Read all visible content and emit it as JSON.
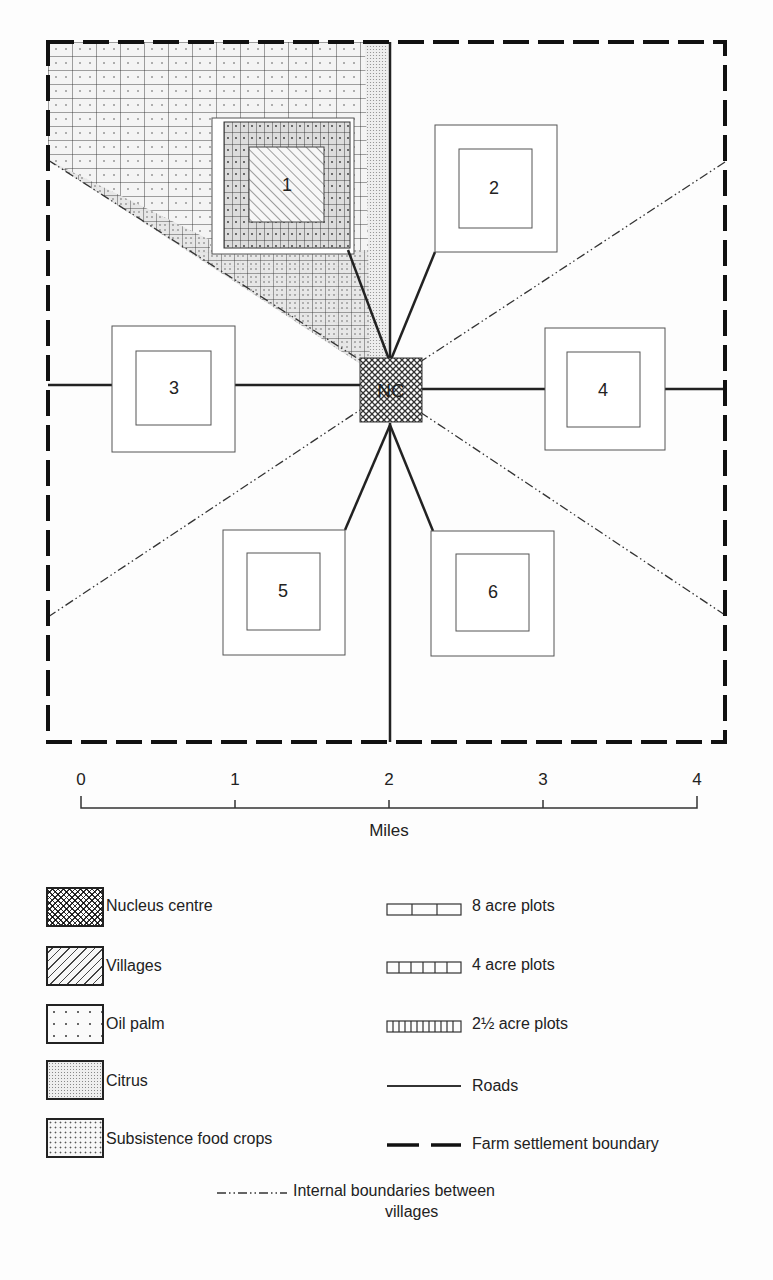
{
  "diagram": {
    "title": "",
    "center": {
      "label": "NC",
      "name": "Nucleus centre"
    },
    "villages": [
      {
        "id": "village-1",
        "label": "1",
        "pattern": "villages-hatched"
      },
      {
        "id": "village-2",
        "label": "2"
      },
      {
        "id": "village-3",
        "label": "3"
      },
      {
        "id": "village-4",
        "label": "4"
      },
      {
        "id": "village-5",
        "label": "5"
      },
      {
        "id": "village-6",
        "label": "6"
      }
    ]
  },
  "scale_bar": {
    "ticks": [
      "0",
      "1",
      "2",
      "3",
      "4"
    ],
    "unit": "Miles"
  },
  "legend": {
    "left": [
      {
        "key": "nucleus",
        "label": "Nucleus centre"
      },
      {
        "key": "villages",
        "label": "Villages"
      },
      {
        "key": "oilpalm",
        "label": "Oil palm"
      },
      {
        "key": "citrus",
        "label": "Citrus"
      },
      {
        "key": "subsistence",
        "label": "Subsistence food crops"
      }
    ],
    "right": [
      {
        "key": "plot8",
        "label": "8 acre plots"
      },
      {
        "key": "plot4",
        "label": "4 acre plots"
      },
      {
        "key": "plot25",
        "label": "2½ acre plots"
      },
      {
        "key": "roads",
        "label": "Roads"
      },
      {
        "key": "boundary",
        "label": "Farm settlement boundary"
      }
    ],
    "bottom": {
      "key": "internal",
      "label_line1": "Internal boundaries between",
      "label_line2": "villages"
    }
  },
  "colors": {
    "ink": "#222222",
    "paper": "#fdfdfd"
  }
}
